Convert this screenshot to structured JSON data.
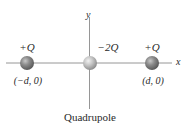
{
  "diagram": {
    "title": "Quadrupole",
    "axes": {
      "x_label": "x",
      "y_label": "y",
      "color": "#8a8a8a"
    },
    "charges": [
      {
        "id": "left",
        "label": "+Q",
        "coord_label": "(−d, 0)",
        "x": 27,
        "y": 63,
        "color": "#7a7a7a"
      },
      {
        "id": "center",
        "label": "−2Q",
        "coord_label": "",
        "x": 90,
        "y": 63,
        "color": "#b8b8b8"
      },
      {
        "id": "right",
        "label": "+Q",
        "coord_label": "(d, 0)",
        "x": 152,
        "y": 63,
        "color": "#7a7a7a"
      }
    ]
  }
}
